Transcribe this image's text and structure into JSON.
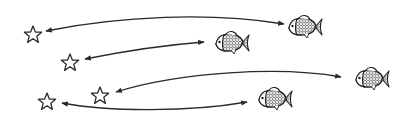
{
  "diagram": {
    "title": "Star-to-fish matching",
    "stroke_color": "#2a2a2a",
    "background": "#ffffff",
    "stars": [
      {
        "id": "star-1",
        "x": 33,
        "y": 35
      },
      {
        "id": "star-2",
        "x": 70,
        "y": 63
      },
      {
        "id": "star-3",
        "x": 100,
        "y": 96
      },
      {
        "id": "star-4",
        "x": 47,
        "y": 102
      }
    ],
    "fish": [
      {
        "id": "fish-1",
        "x": 307,
        "y": 27
      },
      {
        "id": "fish-2",
        "x": 233,
        "y": 43
      },
      {
        "id": "fish-3",
        "x": 373,
        "y": 79
      },
      {
        "id": "fish-4",
        "x": 276,
        "y": 99
      }
    ],
    "connections": [
      {
        "from": "star-1",
        "to": "fish-1",
        "type": "double-arrow"
      },
      {
        "from": "star-2",
        "to": "fish-2",
        "type": "double-arrow"
      },
      {
        "from": "star-3",
        "to": "fish-3",
        "type": "double-arrow"
      },
      {
        "from": "star-4",
        "to": "fish-4",
        "type": "double-arrow"
      }
    ]
  }
}
